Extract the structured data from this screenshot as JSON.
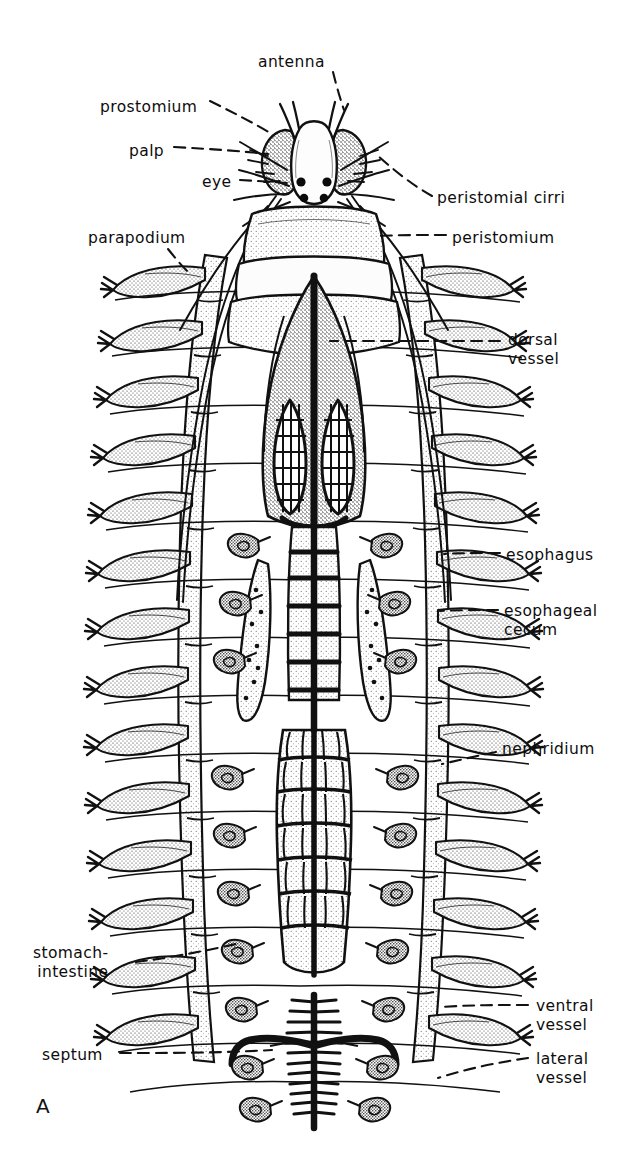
{
  "figure": {
    "panel_label": "A",
    "background_color": "#ffffff",
    "ink_color": "#111111"
  },
  "labels": [
    {
      "id": "antenna",
      "text": "antenna",
      "side": "top",
      "x": 258,
      "y": 53,
      "align": "left"
    },
    {
      "id": "prostomium",
      "text": "prostomium",
      "side": "left",
      "x": 100,
      "y": 98,
      "align": "left"
    },
    {
      "id": "palp",
      "text": "palp",
      "side": "left",
      "x": 129,
      "y": 142,
      "align": "left"
    },
    {
      "id": "eye",
      "text": "eye",
      "side": "left",
      "x": 202,
      "y": 173,
      "align": "left"
    },
    {
      "id": "parapodium",
      "text": "parapodium",
      "side": "left",
      "x": 88,
      "y": 229,
      "align": "left"
    },
    {
      "id": "stomach-intestine",
      "text": "stomach-\nintestine",
      "side": "left",
      "x": 33,
      "y": 944,
      "align": "left"
    },
    {
      "id": "septum",
      "text": "septum",
      "side": "left",
      "x": 42,
      "y": 1046,
      "align": "left"
    },
    {
      "id": "peristomial-cirri",
      "text": "peristomial cirri",
      "side": "right",
      "x": 437,
      "y": 189,
      "align": "left"
    },
    {
      "id": "peristomium",
      "text": "peristomium",
      "side": "right",
      "x": 452,
      "y": 229,
      "align": "left"
    },
    {
      "id": "dorsal-vessel",
      "text": "dorsal\nvessel",
      "side": "right",
      "x": 508,
      "y": 331,
      "align": "left"
    },
    {
      "id": "esophagus",
      "text": "esophagus",
      "side": "right",
      "x": 506,
      "y": 546,
      "align": "left"
    },
    {
      "id": "esophageal-cecum",
      "text": "esophageal\ncecum",
      "side": "right",
      "x": 504,
      "y": 602,
      "align": "left"
    },
    {
      "id": "nephridium",
      "text": "nephridium",
      "side": "right",
      "x": 502,
      "y": 740,
      "align": "left"
    },
    {
      "id": "ventral-vessel",
      "text": "ventral\nvessel",
      "side": "right",
      "x": 536,
      "y": 997,
      "align": "left"
    },
    {
      "id": "lateral-vessel",
      "text": "lateral\nvessel",
      "side": "right",
      "x": 536,
      "y": 1050,
      "align": "left"
    }
  ],
  "anatomy": {
    "head": {
      "eye_count": 4,
      "palp_count": 2,
      "antenna_count": 2,
      "peristomial_cirri_count": 8
    },
    "body": {
      "segment_count": 16,
      "parapodia_per_side": 13,
      "nephridia_pairs": 6,
      "esophageal_ceca": 2
    },
    "organs": [
      "prostomium",
      "palp",
      "eye",
      "antenna",
      "peristomium",
      "peristomial cirri",
      "parapodium",
      "dorsal vessel",
      "esophagus",
      "esophageal cecum",
      "nephridium",
      "stomach-intestine",
      "ventral vessel",
      "lateral vessel",
      "septum"
    ]
  }
}
